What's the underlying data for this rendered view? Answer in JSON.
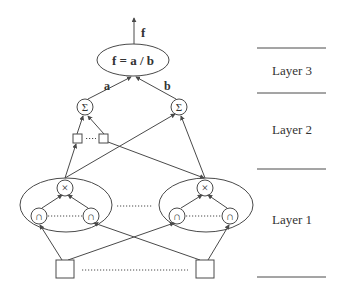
{
  "diagram": {
    "output_label": "f",
    "output_node": "f = a / b",
    "edge_labels": {
      "left": "a",
      "right": "b"
    },
    "sum_symbol": "Σ",
    "product_symbol": "×",
    "membership_symbol": "∩",
    "layers": [
      {
        "label": "Layer 3"
      },
      {
        "label": "Layer 2"
      },
      {
        "label": "Layer 1"
      }
    ],
    "colors": {
      "line": "#4a4a4a",
      "text": "#333333",
      "background": "#ffffff"
    }
  }
}
